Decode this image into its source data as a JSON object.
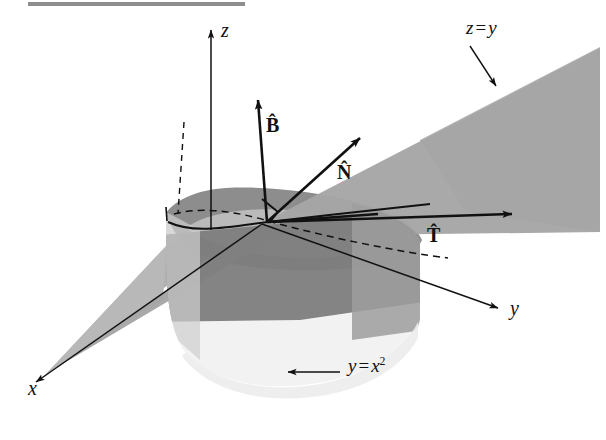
{
  "figure": {
    "title_bar": {
      "present": true,
      "color": "#7a7a7a",
      "x": 28,
      "y": 2,
      "width": 217,
      "height": 4
    },
    "background_color": "#ffffff",
    "ink_color": "#111111",
    "surface_colors": {
      "cylinder_shadow": "#9a9a9a",
      "cylinder_lit": "#f2f2f2",
      "cylinder_top_dark": "#8f8f8f",
      "plane_light": "#b9b9b9",
      "plane_mid": "#a7a7a7",
      "plane_dark": "#7e7e7e"
    },
    "axes": [
      {
        "name": "z",
        "label": "z",
        "label_x": 222,
        "label_y": 22,
        "direction": "up"
      },
      {
        "name": "y",
        "label": "y",
        "label_x": 512,
        "label_y": 300,
        "direction": "down-right"
      },
      {
        "name": "x",
        "label": "x",
        "label_x": 28,
        "label_y": 388,
        "direction": "down-left"
      }
    ],
    "vectors": [
      {
        "name": "B",
        "label": "B̂",
        "label_x": 268,
        "label_y": 118,
        "description": "binormal-unit-vector"
      },
      {
        "name": "N",
        "label": "N̂",
        "label_x": 338,
        "label_y": 165,
        "description": "principal-normal-unit-vector"
      },
      {
        "name": "T",
        "label": "T̂",
        "label_x": 428,
        "label_y": 228,
        "description": "tangent-unit-vector"
      }
    ],
    "surface_annotations": [
      {
        "name": "plane-z-equals-y",
        "label_html": "z = y",
        "label_text": "z = y",
        "lhs": "z",
        "op": "=",
        "rhs": "y",
        "label_x": 468,
        "label_y": 22,
        "leader_from": [
          470,
          48
        ],
        "leader_to": [
          497,
          88
        ]
      },
      {
        "name": "cylinder-y-equals-x-squared",
        "label_text": "y = x2",
        "lhs": "y",
        "op": "=",
        "rhs": "x",
        "exponent": "2",
        "label_x": 348,
        "label_y": 358,
        "leader_from": [
          340,
          373
        ],
        "leader_to": [
          287,
          373
        ]
      }
    ],
    "right_angle_marker": {
      "name": "right-angle-marker",
      "present": true,
      "x": 262,
      "y": 203
    },
    "origin_point": {
      "x": 267,
      "y": 222
    }
  }
}
